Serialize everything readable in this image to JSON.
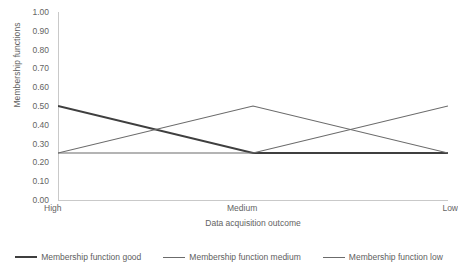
{
  "chart_data": {
    "type": "line",
    "title": "",
    "xlabel": "Data acquisition outcome",
    "ylabel": "Membership functions",
    "categories": [
      "High",
      "Medium",
      "Low"
    ],
    "ylim": [
      0.0,
      1.0
    ],
    "ytick_labels": [
      "1.00",
      "0.90",
      "0.80",
      "0.70",
      "0.60",
      "0.50",
      "0.40",
      "0.30",
      "0.20",
      "0.10",
      "0.00"
    ],
    "ytick_values": [
      1.0,
      0.9,
      0.8,
      0.7,
      0.6,
      0.5,
      0.4,
      0.3,
      0.2,
      0.1,
      0.0
    ],
    "grid": false,
    "legend_position": "bottom",
    "series": [
      {
        "name": "Membership function good",
        "values": [
          0.5,
          0.25,
          0.25
        ],
        "color": "#3f3f3f",
        "width": 2.0
      },
      {
        "name": "Membership function medium",
        "values": [
          0.25,
          0.5,
          0.25
        ],
        "color": "#6b6b6b",
        "width": 1.2
      },
      {
        "name": "Membership function low",
        "values": [
          0.25,
          0.25,
          0.5
        ],
        "color": "#6b6b6b",
        "width": 1.2
      }
    ]
  },
  "axis": {
    "axis_color": "#c9c9c9"
  }
}
